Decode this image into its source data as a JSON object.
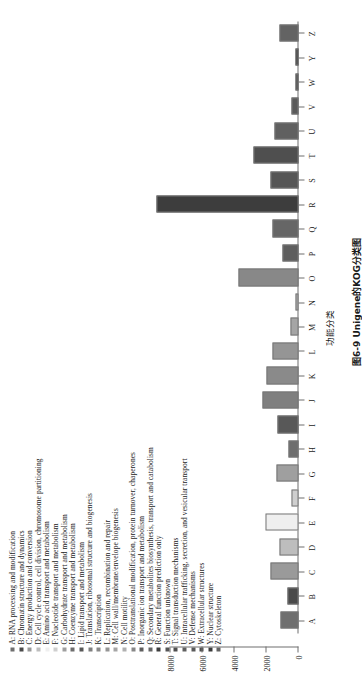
{
  "figure": {
    "caption": "图6-9  Unigene的KOG分类图"
  },
  "chart_data": {
    "type": "bar",
    "orientation": "vertical",
    "title": "",
    "xlabel": "功能分类",
    "ylabel": "",
    "ylim": [
      0,
      8000
    ],
    "yticks": [
      0,
      2000,
      4000,
      6000,
      8000
    ],
    "ytick_labels": [
      "0",
      "2000",
      "4000",
      "6000",
      "8000"
    ],
    "grid": false,
    "legend_position": "top",
    "categories": [
      "A",
      "B",
      "C",
      "D",
      "E",
      "F",
      "G",
      "H",
      "I",
      "J",
      "K",
      "L",
      "M",
      "N",
      "O",
      "P",
      "Q",
      "R",
      "S",
      "T",
      "U",
      "V",
      "W",
      "Y",
      "Z"
    ],
    "values": [
      1020,
      560,
      1620,
      1050,
      1930,
      330,
      1260,
      480,
      1190,
      2130,
      1850,
      1480,
      380,
      60,
      3620,
      900,
      1510,
      8770,
      1600,
      2700,
      1400,
      290,
      60,
      55,
      1070
    ],
    "colors": [
      "#6f6f6f",
      "#4a4a4a",
      "#9a9a9a",
      "#bdbdbd",
      "#efefef",
      "#cfcfcf",
      "#9f9f9f",
      "#6e6e6e",
      "#585858",
      "#7f7f7f",
      "#8a8a8a",
      "#959595",
      "#a5a5a5",
      "#b0b0b0",
      "#888888",
      "#5e5e5e",
      "#666666",
      "#3d3d3d",
      "#555555",
      "#4f4f4f",
      "#606060",
      "#5a5a5a",
      "#4c4c4c",
      "#3a3a3a",
      "#636363"
    ],
    "legend": [
      {
        "key": "A",
        "label": "A: RNA processing and modification",
        "color": "#6f6f6f"
      },
      {
        "key": "B",
        "label": "B: Chromatin structure and dynamics",
        "color": "#4a4a4a"
      },
      {
        "key": "C",
        "label": "C: Energy production and conversion",
        "color": "#9a9a9a"
      },
      {
        "key": "D",
        "label": "D: Cell cycle control, cell division, chromosome partitioning",
        "color": "#bdbdbd"
      },
      {
        "key": "E",
        "label": "E: Amino acid transport and metabolism",
        "color": "#efefef"
      },
      {
        "key": "F",
        "label": "F: Nucleotide transport and metabolism",
        "color": "#cfcfcf"
      },
      {
        "key": "G",
        "label": "G: Carbohydrate transport and metabolism",
        "color": "#9f9f9f"
      },
      {
        "key": "H",
        "label": "H: Coenzyme transport and metabolism",
        "color": "#6e6e6e"
      },
      {
        "key": "I",
        "label": "I: Lipid transport and metabolism",
        "color": "#585858"
      },
      {
        "key": "J",
        "label": "J: Translation, ribosomal structure and biogenesis",
        "color": "#7f7f7f"
      },
      {
        "key": "K",
        "label": "K: Transcription",
        "color": "#8a8a8a"
      },
      {
        "key": "L",
        "label": "L: Replication, recombination and repair",
        "color": "#959595"
      },
      {
        "key": "M",
        "label": "M: Cell wall/membrane/envelope biogenesis",
        "color": "#a5a5a5"
      },
      {
        "key": "N",
        "label": "N: Cell motility",
        "color": "#b0b0b0"
      },
      {
        "key": "O",
        "label": "O: Posttranslational modification, protein turnover, chaperones",
        "color": "#888888"
      },
      {
        "key": "P",
        "label": "P: Inorganic ion transport and metabolism",
        "color": "#5e5e5e"
      },
      {
        "key": "Q",
        "label": "Q: Secondary metabolites biosynthesis, transport and catabolism",
        "color": "#666666"
      },
      {
        "key": "R",
        "label": "R: General function prediction only",
        "color": "#3d3d3d"
      },
      {
        "key": "S",
        "label": "S: Function unknown",
        "color": "#555555"
      },
      {
        "key": "T",
        "label": "T: Signal transduction mechanisms",
        "color": "#4f4f4f"
      },
      {
        "key": "U",
        "label": "U: Intracellular trafficking, secretion, and vesicular transport",
        "color": "#606060"
      },
      {
        "key": "V",
        "label": "V: Defense mechanisms",
        "color": "#5a5a5a"
      },
      {
        "key": "W",
        "label": "W: Extracellular structures",
        "color": "#4c4c4c"
      },
      {
        "key": "Y",
        "label": "Y: Nuclear structure",
        "color": "#3a3a3a"
      },
      {
        "key": "Z",
        "label": "Z: Cytoskeleton",
        "color": "#636363"
      }
    ]
  }
}
